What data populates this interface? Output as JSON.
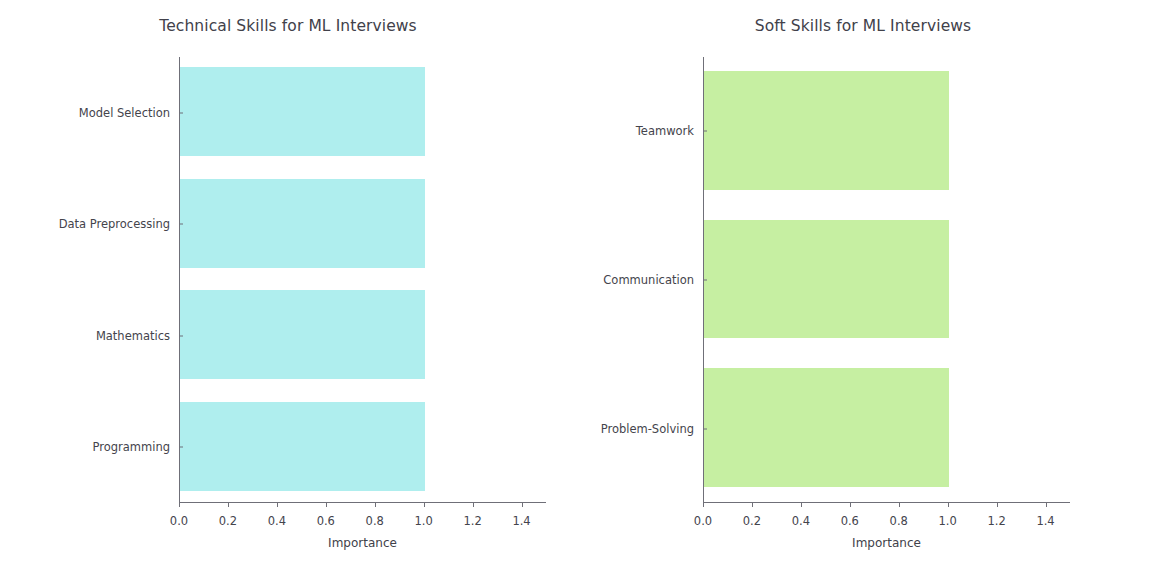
{
  "chart_data": [
    {
      "type": "bar",
      "orientation": "horizontal",
      "title": "Technical Skills for ML Interviews",
      "xlabel": "Importance",
      "ylabel": "",
      "categories": [
        "Programming",
        "Mathematics",
        "Data Preprocessing",
        "Model Selection"
      ],
      "values": [
        1.0,
        1.0,
        1.0,
        1.0
      ],
      "xticks": [
        "0.0",
        "0.2",
        "0.4",
        "0.6",
        "0.8",
        "1.0",
        "1.2",
        "1.4"
      ],
      "xtick_values": [
        0.0,
        0.2,
        0.4,
        0.6,
        0.8,
        1.0,
        1.2,
        1.4
      ],
      "xlim": [
        0.0,
        1.5
      ],
      "grid": false,
      "legend": null,
      "color": "#afeeee"
    },
    {
      "type": "bar",
      "orientation": "horizontal",
      "title": "Soft Skills for ML Interviews",
      "xlabel": "Importance",
      "ylabel": "",
      "categories": [
        "Problem-Solving",
        "Communication",
        "Teamwork"
      ],
      "values": [
        1.0,
        1.0,
        1.0
      ],
      "xticks": [
        "0.0",
        "0.2",
        "0.4",
        "0.6",
        "0.8",
        "1.0",
        "1.2",
        "1.4"
      ],
      "xtick_values": [
        0.0,
        0.2,
        0.4,
        0.6,
        0.8,
        1.0,
        1.2,
        1.4
      ],
      "xlim": [
        0.0,
        1.5
      ],
      "grid": false,
      "legend": null,
      "color": "#c6efa2"
    }
  ],
  "figure": {
    "background": "#ffffff",
    "axis_color": "#6f6f78",
    "text_color": "#41414a"
  }
}
